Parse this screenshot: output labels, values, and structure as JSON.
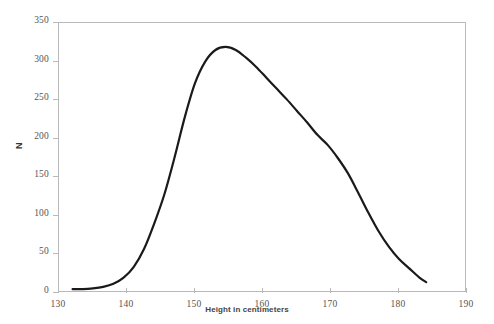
{
  "chart_data": {
    "type": "line",
    "title": "",
    "xlabel": "Height in centimeters",
    "ylabel": "N",
    "xlim": [
      130,
      190
    ],
    "ylim": [
      0,
      350
    ],
    "xticks": [
      130,
      140,
      150,
      160,
      170,
      180,
      190
    ],
    "yticks": [
      0,
      50,
      100,
      150,
      200,
      250,
      300,
      350
    ],
    "grid": false,
    "legend": null,
    "line_color": "#1a1a1a",
    "line_width": 2.2,
    "frame_color": "#b9b9b9",
    "background": "#ffffff",
    "series": [
      {
        "name": "Height distribution",
        "x": [
          132.0,
          133.5,
          135.0,
          136.5,
          138.0,
          139.5,
          141.0,
          142.5,
          144.0,
          145.5,
          147.0,
          148.5,
          150.0,
          151.5,
          153.0,
          154.5,
          156.0,
          157.5,
          159.0,
          160.5,
          162.0,
          163.5,
          165.0,
          166.5,
          168.0,
          169.5,
          171.0,
          172.5,
          174.0,
          175.5,
          177.0,
          178.5,
          180.0,
          181.5,
          183.0,
          184.0
        ],
        "y": [
          5,
          5,
          6,
          8,
          12,
          20,
          34,
          57,
          90,
          128,
          176,
          228,
          272,
          300,
          315,
          319,
          315,
          305,
          293,
          279,
          265,
          251,
          236,
          221,
          205,
          192,
          175,
          155,
          130,
          104,
          80,
          60,
          44,
          32,
          20,
          14
        ]
      }
    ]
  },
  "axis_labels": {
    "x_ticks": [
      "130",
      "140",
      "150",
      "160",
      "170",
      "180",
      "190"
    ],
    "y_ticks": [
      "350",
      "300",
      "250",
      "200",
      "150",
      "100",
      "50",
      "0"
    ],
    "x_title": "Height in centimeters",
    "y_title": "N"
  }
}
